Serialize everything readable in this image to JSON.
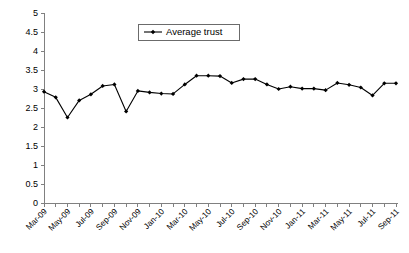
{
  "chart_data": {
    "type": "line",
    "title": "",
    "xlabel": "",
    "ylabel": "",
    "ylim": [
      0,
      5
    ],
    "ytick_step": 0.5,
    "yticks": [
      "0",
      "0.5",
      "1",
      "1.5",
      "2",
      "2.5",
      "3",
      "3.5",
      "4",
      "4.5",
      "5"
    ],
    "grid": false,
    "legend_position": "top-center",
    "legend": [
      "Average trust"
    ],
    "x": [
      "Mar-09",
      "Apr-09",
      "May-09",
      "Jun-09",
      "Jul-09",
      "Aug-09",
      "Sep-09",
      "Oct-09",
      "Nov-09",
      "Dec-09",
      "Jan-10",
      "Feb-10",
      "Mar-10",
      "Apr-10",
      "May-10",
      "Jun-10",
      "Jul-10",
      "Aug-10",
      "Sep-10",
      "Oct-10",
      "Nov-10",
      "Dec-10",
      "Jan-11",
      "Feb-11",
      "Mar-11",
      "Apr-11",
      "May-11",
      "Jun-11",
      "Jul-11",
      "Aug-11",
      "Sep-11"
    ],
    "xtick_labels": [
      "Mar-09",
      "May-09",
      "Jul-09",
      "Sep-09",
      "Nov-09",
      "Jan-10",
      "Mar-10",
      "May-10",
      "Jul-10",
      "Sep-10",
      "Nov-10",
      "Jan-11",
      "Mar-11",
      "May-11",
      "Jul-11",
      "Sep-11"
    ],
    "series": [
      {
        "name": "Average trust",
        "color": "#000000",
        "marker": "diamond",
        "values": [
          2.93,
          2.78,
          2.25,
          2.7,
          2.86,
          3.08,
          3.12,
          2.41,
          2.95,
          2.91,
          2.88,
          2.87,
          3.12,
          3.35,
          3.35,
          3.34,
          3.16,
          3.26,
          3.26,
          3.12,
          3.0,
          3.06,
          3.01,
          3.01,
          2.97,
          3.16,
          3.11,
          3.04,
          2.83,
          3.15,
          3.15
        ]
      }
    ]
  },
  "legend": {
    "label": "Average trust"
  }
}
